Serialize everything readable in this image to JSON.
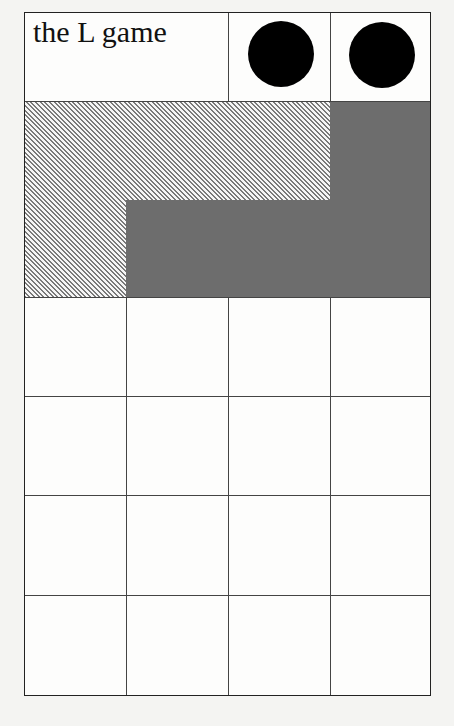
{
  "title": "the L game",
  "board": {
    "columns": 4,
    "rows": 4,
    "header_row": {
      "title_cell_span": 2,
      "neutral_pieces": 2
    },
    "colors": {
      "background": "#fdfdfc",
      "grid": "#444444",
      "solid_L": "#6d6d6d",
      "hatched_L": "#7a7a7a",
      "neutral_piece": "#000000"
    }
  },
  "pieces": {
    "hatched_L": {
      "name": "hatched L piece",
      "cells": [
        [
          0,
          0
        ],
        [
          0,
          1
        ],
        [
          0,
          2
        ],
        [
          1,
          0
        ]
      ]
    },
    "solid_L": {
      "name": "solid grey L piece",
      "cells": [
        [
          0,
          3
        ],
        [
          1,
          1
        ],
        [
          1,
          2
        ],
        [
          1,
          3
        ]
      ]
    },
    "neutral": [
      {
        "name": "neutral piece 1"
      },
      {
        "name": "neutral piece 2"
      }
    ]
  }
}
